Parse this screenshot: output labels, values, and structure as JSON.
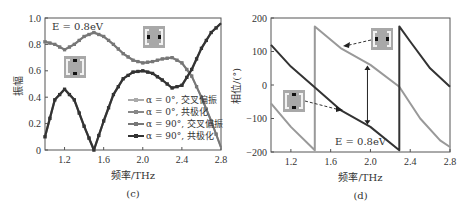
{
  "chart_data": [
    {
      "type": "line",
      "panel": "(c)",
      "title": "",
      "xlabel": "频率/THz",
      "ylabel": "振幅",
      "xlim": [
        1.0,
        2.8
      ],
      "ylim": [
        0,
        1.0
      ],
      "xticks": [
        "1.2",
        "1.6",
        "2.0",
        "2.4",
        "2.8"
      ],
      "yticks": [
        "0",
        "0.2",
        "0.4",
        "0.6",
        "0.8",
        "1.0"
      ],
      "annotation": "E = 0.8eV",
      "grid": false,
      "legend_position": "lower right",
      "x": [
        1.0,
        1.1,
        1.2,
        1.3,
        1.4,
        1.5,
        1.6,
        1.7,
        1.8,
        1.9,
        2.0,
        2.1,
        2.2,
        2.3,
        2.4,
        2.5,
        2.6,
        2.7,
        2.8
      ],
      "series": [
        {
          "name": "α = 0°, 交叉偏振",
          "color": "#aaaaaa",
          "values": [
            0.82,
            0.8,
            0.76,
            0.8,
            0.86,
            0.89,
            0.86,
            0.8,
            0.73,
            0.68,
            0.66,
            0.67,
            0.69,
            0.7,
            0.66,
            0.56,
            0.4,
            0.22,
            0.02
          ]
        },
        {
          "name": "α = 0°, 共极化",
          "color": "#888888",
          "values": [
            0.1,
            0.38,
            0.46,
            0.38,
            0.18,
            0.0,
            0.22,
            0.42,
            0.54,
            0.59,
            0.6,
            0.58,
            0.53,
            0.47,
            0.49,
            0.61,
            0.77,
            0.89,
            0.96
          ]
        },
        {
          "name": "α = 90°, 交叉偏振",
          "color": "#777777",
          "values": [
            0.82,
            0.8,
            0.76,
            0.8,
            0.86,
            0.89,
            0.86,
            0.8,
            0.73,
            0.68,
            0.66,
            0.67,
            0.69,
            0.7,
            0.66,
            0.56,
            0.4,
            0.22,
            0.02
          ]
        },
        {
          "name": "α = 90°, 共极化",
          "color": "#333333",
          "values": [
            0.1,
            0.38,
            0.46,
            0.38,
            0.18,
            0.0,
            0.22,
            0.42,
            0.54,
            0.59,
            0.6,
            0.58,
            0.53,
            0.47,
            0.49,
            0.61,
            0.77,
            0.89,
            0.96
          ]
        }
      ]
    },
    {
      "type": "line",
      "panel": "(d)",
      "title": "",
      "xlabel": "频率/THz",
      "ylabel": "相位/(°)",
      "xlim": [
        1.0,
        2.8
      ],
      "ylim": [
        -200,
        200
      ],
      "xticks": [
        "1.2",
        "1.6",
        "2.0",
        "2.4",
        "2.8"
      ],
      "yticks": [
        "-200",
        "-100",
        "0",
        "100",
        "200"
      ],
      "annotation": "E = 0.8eV",
      "grid": false,
      "series": [
        {
          "name": "α = 90° phase",
          "color": "#333333",
          "x": [
            1.0,
            1.2,
            1.45,
            1.7,
            2.0,
            2.29,
            2.29,
            2.4,
            2.6,
            2.8
          ],
          "values": [
            120,
            55,
            -10,
            -75,
            -125,
            -195,
            175,
            130,
            50,
            -5
          ]
        },
        {
          "name": "α = 0° phase",
          "color": "#999999",
          "x": [
            1.0,
            1.2,
            1.44,
            1.44,
            1.7,
            2.0,
            2.29,
            2.5,
            2.7,
            2.8
          ],
          "values": [
            -55,
            -125,
            -195,
            175,
            110,
            60,
            -5,
            -100,
            -165,
            -185
          ]
        }
      ]
    }
  ],
  "labels": {
    "c": {
      "ylabel": "振幅",
      "xlabel": "频率/THz",
      "panel": "(c)",
      "annotation": "E = 0.8eV",
      "legend": [
        "α = 0°, 交叉偏振",
        "α = 0°, 共极化",
        "α = 90°, 交叉偏振",
        "α = 90°, 共极化"
      ]
    },
    "d": {
      "ylabel": "相位/(°)",
      "xlabel": "频率/THz",
      "panel": "(d)",
      "annotation": "E = 0.8eV"
    }
  }
}
